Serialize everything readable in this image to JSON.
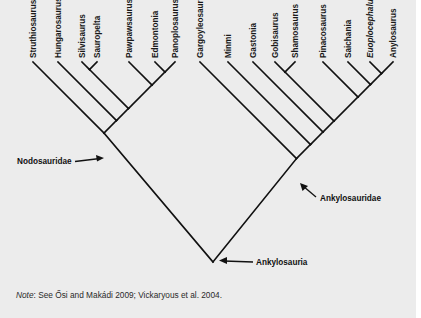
{
  "figure": {
    "type": "cladogram",
    "root": {
      "label": "Ankylosauria",
      "children": [
        "Nodosauridae",
        "Ankylosauridae"
      ]
    },
    "clades": [
      {
        "id": "nodosauridae",
        "label": "Nodosauridae",
        "topology": [
          "Struthiosaurus",
          [
            "Hungarosaurus",
            [
              "Silvisaurus",
              "Sauropelta"
            ],
            [
              "Pawpawsaurus",
              [
                "Edmontonia",
                "Panoplosaurus"
              ]
            ]
          ]
        ]
      },
      {
        "id": "ankylosauridae",
        "label": "Ankylosauridae",
        "topology": [
          "Gargoyleosaurus",
          [
            "Minmi",
            [
              "Gastonia",
              [
                [
                  "Gobisaurus",
                  "Shamosaurus"
                ],
                [
                  "Pinacosaurus",
                  [
                    "Saichania",
                    [
                      "Euoplocephalus",
                      "Anylosaurus"
                    ]
                  ]
                ]
              ]
            ]
          ]
        ]
      }
    ],
    "tips": [
      {
        "name": "Struthiosaurus"
      },
      {
        "name": "Hungarosaurus"
      },
      {
        "name": "Silvisaurus"
      },
      {
        "name": "Sauropelta"
      },
      {
        "name": "Pawpawsaurus"
      },
      {
        "name": "Edmontonia"
      },
      {
        "name": "Panoplosaurus"
      },
      {
        "name": "Gargoyleosaurus"
      },
      {
        "name": "Minmi"
      },
      {
        "name": "Gastonia"
      },
      {
        "name": "Gobisaurus"
      },
      {
        "name": "Shamosaurus"
      },
      {
        "name": "Pinacosaurus"
      },
      {
        "name": "Saichania"
      },
      {
        "name": "Euoplocephalus"
      },
      {
        "name": "Anylosaurus"
      }
    ],
    "labels": {
      "nodosauridae": "Nodosauridae",
      "ankylosauridae": "Ankylosauridae",
      "ankylosauria": "Ankylosauria"
    }
  },
  "note": {
    "prefix": "Note",
    "text": ": See Ősi and Makádi 2009; Vickaryous et al. 2004."
  },
  "colors": {
    "background": "#ececec",
    "lines": "#111111"
  }
}
